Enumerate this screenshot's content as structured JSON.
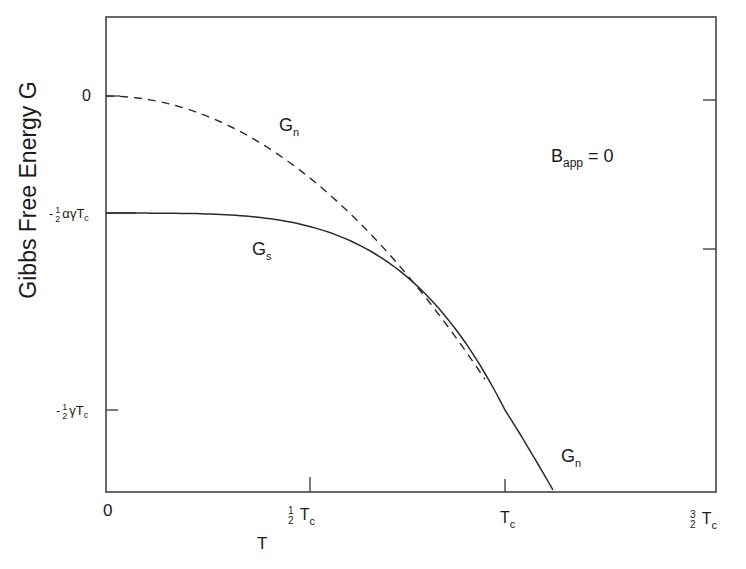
{
  "chart_data": {
    "type": "line",
    "title": "",
    "xlabel": "T",
    "ylabel": "Gibbs Free Energy G",
    "annotation": {
      "text_main": "B",
      "text_sub": "app",
      "text_rest": " = 0"
    },
    "x_ticks": [
      {
        "label": "0",
        "value": 0
      },
      {
        "label": "1/2 Tc",
        "value": 0.5
      },
      {
        "label": "Tc",
        "value": 1.0
      },
      {
        "label": "3/2 Tc",
        "value": 1.5
      }
    ],
    "y_ticks": [
      {
        "label": "0",
        "value": 0
      },
      {
        "label": "-1/2 αγTc",
        "value": -0.1865
      },
      {
        "label": "-1/2 γTc",
        "value": -0.5
      }
    ],
    "xlim": [
      0,
      1.51
    ],
    "ylim": [
      -0.63,
      0.12
    ],
    "units": {
      "x": "T / Tc",
      "y": "G / (γTc²)"
    },
    "grid": false,
    "series": [
      {
        "name": "Gn",
        "style": "dashed",
        "x": [
          0,
          0.1,
          0.2,
          0.3,
          0.4,
          0.5,
          0.6,
          0.7,
          0.8,
          0.9,
          1.0
        ],
        "values": [
          0,
          -0.005,
          -0.02,
          -0.045,
          -0.08,
          -0.125,
          -0.18,
          -0.245,
          -0.32,
          -0.405,
          -0.5
        ]
      },
      {
        "name": "Gs",
        "style": "solid",
        "x": [
          0,
          0.1,
          0.2,
          0.3,
          0.4,
          0.5,
          0.6,
          0.7,
          0.8,
          0.9,
          1.0
        ],
        "values": [
          -0.1865,
          -0.1865,
          -0.187,
          -0.189,
          -0.1945,
          -0.2061,
          -0.2271,
          -0.2618,
          -0.3149,
          -0.3922,
          -0.5
        ]
      },
      {
        "name": "Gn",
        "style": "solid",
        "x": [
          1.0,
          1.05,
          1.1,
          1.12
        ],
        "values": [
          -0.5,
          -0.551,
          -0.605,
          -0.627
        ]
      }
    ]
  },
  "labels": {
    "y_axis": "Gibbs Free Energy G",
    "x_axis": "T",
    "gn_upper": {
      "main": "G",
      "sub": "n"
    },
    "gs": {
      "main": "G",
      "sub": "s"
    },
    "gn_lower": {
      "main": "G",
      "sub": "n"
    },
    "bapp": {
      "main": "B",
      "sub": "app",
      "rest": " = 0"
    },
    "x_tick_0": "0",
    "x_tick_half": {
      "num": "1",
      "den": "2",
      "main": "T",
      "sub": "c"
    },
    "x_tick_tc": {
      "main": "T",
      "sub": "c"
    },
    "x_tick_3half": {
      "num": "3",
      "den": "2",
      "main": "T",
      "sub": "c"
    },
    "y_tick_0": "0",
    "y_tick_alpha": {
      "sign": "-",
      "num": "1",
      "den": "2",
      "main": "αγT",
      "sub": "c"
    },
    "y_tick_gamma": {
      "sign": "-",
      "num": "1",
      "den": "2",
      "main": "γT",
      "sub": "c"
    }
  },
  "colors": {
    "line": "#2a2a2a",
    "frame": "#444444",
    "background": "#ffffff"
  }
}
